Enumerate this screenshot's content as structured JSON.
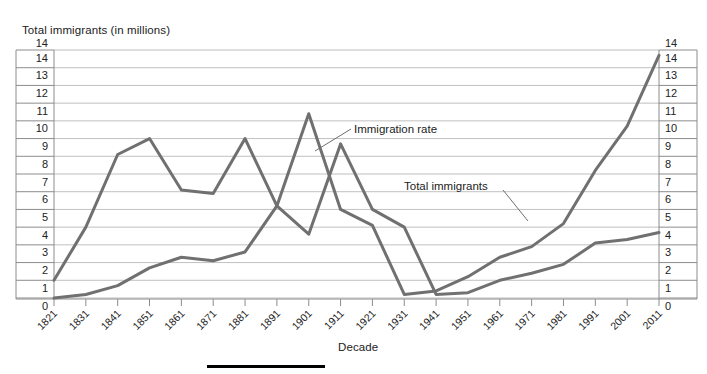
{
  "axis_titles": {
    "y": "Total immigrants (in millions)",
    "x": "Decade"
  },
  "annotations": {
    "immigration_rate": "Immigration rate",
    "total_immigrants": "Total immigrants"
  },
  "colors": {
    "line": "#707070",
    "axis": "#8c8c8c",
    "text": "#222222",
    "footer_bar": "#000000"
  },
  "chart_data": {
    "type": "line",
    "title": "",
    "xlabel": "Decade",
    "ylabel": "Total immigrants (in millions)",
    "ylim": [
      0,
      14
    ],
    "yticks": [
      0,
      1,
      2,
      3,
      4,
      5,
      6,
      7,
      8,
      9,
      10,
      11,
      12,
      13,
      14
    ],
    "ytick_labels": [
      "0",
      "1",
      "2",
      "3",
      "4",
      "5",
      "6",
      "7",
      "8",
      "9",
      "10",
      "11",
      "12",
      "13",
      "14"
    ],
    "grid": true,
    "legend": "annotated-labels",
    "dual_axis": true,
    "right_axis_same_scale": true,
    "categories": [
      "1821",
      "1831",
      "1841",
      "1851",
      "1861",
      "1871",
      "1881",
      "1891",
      "1901",
      "1911",
      "1921",
      "1931",
      "1941",
      "1951",
      "1961",
      "1971",
      "1981",
      "1991",
      "2001",
      "2011"
    ],
    "series": [
      {
        "name": "Immigration rate",
        "values": [
          1.0,
          4.0,
          8.1,
          9.0,
          6.1,
          5.9,
          9.0,
          5.2,
          10.4,
          5.0,
          4.1,
          0.2,
          0.4,
          1.2,
          2.3,
          2.9,
          4.2,
          7.2,
          9.7,
          13.7
        ]
      },
      {
        "name": "Total immigrants",
        "values": [
          0.0,
          0.2,
          0.7,
          1.7,
          2.3,
          2.1,
          2.6,
          5.2,
          3.6,
          8.7,
          5.0,
          4.0,
          0.2,
          0.3,
          1.0,
          1.4,
          1.9,
          3.1,
          3.3,
          3.7
        ]
      }
    ]
  }
}
